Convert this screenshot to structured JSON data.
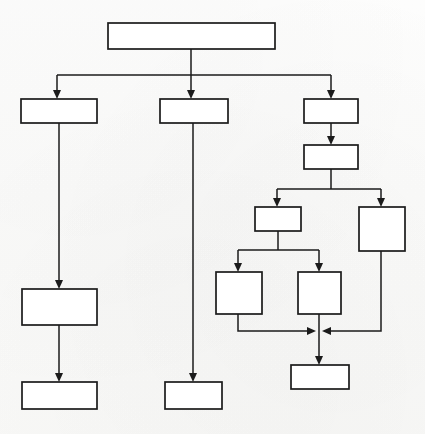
{
  "diagram": {
    "type": "flowchart",
    "orientation": "top-down",
    "background_color": "#fbfbfa",
    "line_color": "#1b1b1b",
    "box_fill_color": "#ffffff",
    "nodes": [
      {
        "id": "root",
        "label": "",
        "x": 108,
        "y": 23,
        "w": 167,
        "h": 26
      },
      {
        "id": "branch-a",
        "label": "",
        "x": 21,
        "y": 99,
        "w": 76,
        "h": 24
      },
      {
        "id": "branch-b",
        "label": "",
        "x": 160,
        "y": 99,
        "w": 68,
        "h": 24
      },
      {
        "id": "branch-c",
        "label": "",
        "x": 304,
        "y": 99,
        "w": 54,
        "h": 24
      },
      {
        "id": "a-mid",
        "label": "",
        "x": 22,
        "y": 289,
        "w": 75,
        "h": 36
      },
      {
        "id": "a-end",
        "label": "",
        "x": 22,
        "y": 382,
        "w": 75,
        "h": 27
      },
      {
        "id": "b-end",
        "label": "",
        "x": 165,
        "y": 382,
        "w": 57,
        "h": 27
      },
      {
        "id": "c-second",
        "label": "",
        "x": 304,
        "y": 145,
        "w": 54,
        "h": 24
      },
      {
        "id": "c-left",
        "label": "",
        "x": 255,
        "y": 207,
        "w": 46,
        "h": 24
      },
      {
        "id": "c-right-tall",
        "label": "",
        "x": 359,
        "y": 207,
        "w": 46,
        "h": 44
      },
      {
        "id": "c-leaf-1",
        "label": "",
        "x": 216,
        "y": 272,
        "w": 46,
        "h": 42
      },
      {
        "id": "c-leaf-2",
        "label": "",
        "x": 298,
        "y": 272,
        "w": 43,
        "h": 42
      },
      {
        "id": "c-end",
        "label": "",
        "x": 291,
        "y": 365,
        "w": 58,
        "h": 24
      }
    ],
    "edges": [
      {
        "id": "root-to-split",
        "from": "root",
        "to": "split-bar-1",
        "arrow": false
      },
      {
        "id": "split-to-branch-a",
        "from": "split-bar-1",
        "to": "branch-a",
        "arrow": true
      },
      {
        "id": "split-to-branch-b",
        "from": "split-bar-1",
        "to": "branch-b",
        "arrow": true
      },
      {
        "id": "split-to-branch-c",
        "from": "split-bar-1",
        "to": "branch-c",
        "arrow": true
      },
      {
        "id": "branch-a-to-a-mid",
        "from": "branch-a",
        "to": "a-mid",
        "arrow": true
      },
      {
        "id": "a-mid-to-a-end",
        "from": "a-mid",
        "to": "a-end",
        "arrow": true
      },
      {
        "id": "branch-b-to-b-end",
        "from": "branch-b",
        "to": "b-end",
        "arrow": true
      },
      {
        "id": "branch-c-to-second",
        "from": "branch-c",
        "to": "c-second",
        "arrow": true
      },
      {
        "id": "second-to-c-left",
        "from": "c-second",
        "to": "c-left",
        "arrow": true
      },
      {
        "id": "second-to-c-right",
        "from": "c-second",
        "to": "c-right-tall",
        "arrow": true
      },
      {
        "id": "c-left-to-leaf-1",
        "from": "c-left",
        "to": "c-leaf-1",
        "arrow": true
      },
      {
        "id": "c-left-to-leaf-2",
        "from": "c-left",
        "to": "c-leaf-2",
        "arrow": true
      },
      {
        "id": "leaf-1-to-merge",
        "from": "c-leaf-1",
        "to": "merge-point",
        "arrow": true
      },
      {
        "id": "right-tall-to-merge",
        "from": "c-right-tall",
        "to": "merge-point",
        "arrow": true
      },
      {
        "id": "leaf-2-to-c-end",
        "from": "c-leaf-2",
        "to": "c-end",
        "arrow": true
      }
    ],
    "connector_bars": [
      {
        "id": "split-bar-1",
        "y": 75,
        "x1": 57,
        "x2": 331,
        "stem_x": 191
      },
      {
        "id": "split-bar-2",
        "y": 189,
        "x1": 277,
        "x2": 381,
        "stem_x": 331
      },
      {
        "id": "split-bar-3",
        "y": 250,
        "x1": 238,
        "x2": 319,
        "stem_x": 278
      },
      {
        "id": "merge-bar",
        "y": 331,
        "x1": 238,
        "x2": 381,
        "stem_x": 319
      }
    ]
  }
}
